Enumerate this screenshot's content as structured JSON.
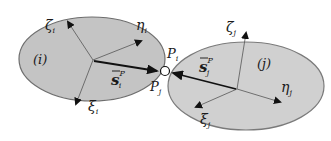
{
  "diagram": {
    "bodies": [
      {
        "id": "i",
        "label": "(i)",
        "fill": "#c4c4c4",
        "stroke": "#6e6e6e",
        "axes": {
          "zeta": "ζ",
          "eta": "η",
          "xi": "ξ",
          "subscript": "i"
        },
        "vector_label": "s",
        "vector_sup": "P",
        "vector_sub": "i"
      },
      {
        "id": "j",
        "label": "(j)",
        "fill": "#d0d0d0",
        "stroke": "#7a7a7a",
        "axes": {
          "zeta": "ζ",
          "eta": "η",
          "xi": "ξ",
          "subscript": "j"
        },
        "vector_label": "s",
        "vector_sup": "P",
        "vector_sub": "j"
      }
    ],
    "joint": {
      "label_top": "P",
      "label_top_sub": "i",
      "label_bottom": "P",
      "label_bottom_sub": "j"
    }
  }
}
